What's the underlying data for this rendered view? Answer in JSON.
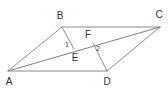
{
  "figure": {
    "kind": "geometry-diagram",
    "width": 168,
    "height": 90,
    "background_color": "#ffffff",
    "stroke_color": "#8a8a8a",
    "stroke_color_dark": "#6f6f6f",
    "label_color": "#2e2e2e",
    "stroke_width": 1,
    "points": [
      {
        "id": "A",
        "label": "A",
        "x": 8,
        "y": 71,
        "label_x": 9,
        "label_y": 82,
        "type": "vertex"
      },
      {
        "id": "B",
        "label": "B",
        "x": 62,
        "y": 27,
        "label_x": 60,
        "label_y": 16,
        "type": "vertex"
      },
      {
        "id": "C",
        "label": "C",
        "x": 160,
        "y": 27,
        "label_x": 159,
        "label_y": 15,
        "type": "vertex"
      },
      {
        "id": "D",
        "label": "D",
        "x": 107,
        "y": 71,
        "label_x": 107,
        "label_y": 82,
        "type": "vertex"
      },
      {
        "id": "E",
        "label": "E",
        "x": 74,
        "y": 49,
        "label_x": 75,
        "label_y": 58,
        "type": "point"
      },
      {
        "id": "F",
        "label": "F",
        "x": 93,
        "y": 43,
        "label_x": 88,
        "label_y": 35,
        "type": "point"
      }
    ],
    "segments": [
      {
        "id": "AB",
        "from": "A",
        "to": "B",
        "name": "side-ab"
      },
      {
        "id": "BC",
        "from": "B",
        "to": "C",
        "name": "side-bc"
      },
      {
        "id": "CD",
        "from": "C",
        "to": "D",
        "name": "side-cd"
      },
      {
        "id": "DA",
        "from": "D",
        "to": "A",
        "name": "side-da"
      },
      {
        "id": "AC",
        "from": "A",
        "to": "C",
        "name": "diagonal-ac"
      },
      {
        "id": "BE",
        "from": "B",
        "to": "E",
        "name": "segment-be"
      },
      {
        "id": "DF",
        "from": "D",
        "to": "F",
        "name": "segment-df"
      }
    ],
    "angles": [
      {
        "id": "1",
        "label": "1",
        "at": "E",
        "label_x": 67,
        "label_y": 44
      },
      {
        "id": "2",
        "label": "2",
        "at": "F",
        "label_x": 98,
        "label_y": 48
      }
    ]
  }
}
